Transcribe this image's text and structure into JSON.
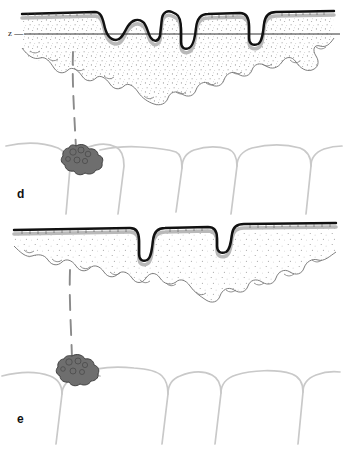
{
  "figure": {
    "background_color": "#ffffff",
    "panels": [
      {
        "id": "d",
        "label": "d",
        "description": "Upper panel: keratinised epithelium with multiple deep invaginations reaching past the reference level z; stippled connective tissue layer; dashed migration path descending to a dark tumour cell cluster positioned between tooth crowns",
        "reference_line": {
          "label": "z",
          "leader_dash": "—",
          "y_position": 34,
          "color": "#1a1a1a"
        },
        "epithelium": {
          "keratin_line_color": "#111111",
          "sub_layer_color": "#b9b9b9",
          "connective_tissue_fill": "#ffffff",
          "stipple_color": "#8e8e8e",
          "invagination_count": 4
        },
        "cell_cluster": {
          "name": "tumour-cell-cluster",
          "fill_color": "#6e6e6e",
          "outline_color": "#3f3f3f",
          "center_x": 75,
          "center_y": 157
        },
        "migration_path": {
          "style": "dashed",
          "color": "#8a8a8a",
          "from_y": 52,
          "to_y": 148
        },
        "teeth": {
          "outline_color": "#c9c9c9",
          "count": 5
        }
      },
      {
        "id": "e",
        "label": "e",
        "description": "Lower panel: flatter keratinised epithelium with one narrow deep invagination and one shallow step; stippled connective tissue; dashed migration path descending to a dark tumour cell cluster between tooth crowns",
        "reference_line": null,
        "epithelium": {
          "keratin_line_color": "#111111",
          "sub_layer_color": "#b9b9b9",
          "connective_tissue_fill": "#ffffff",
          "stipple_color": "#8e8e8e",
          "invagination_count": 2
        },
        "cell_cluster": {
          "name": "tumour-cell-cluster",
          "fill_color": "#6e6e6e",
          "outline_color": "#3f3f3f",
          "center_x": 72,
          "center_y": 368
        },
        "migration_path": {
          "style": "dashed",
          "color": "#8a8a8a",
          "from_y": 272,
          "to_y": 358
        },
        "teeth": {
          "outline_color": "#c9c9c9",
          "count": 5
        }
      }
    ],
    "colors": {
      "ink": "#111111",
      "mid_gray": "#6e6e6e",
      "light_gray": "#c9c9c9",
      "stipple": "#8e8e8e",
      "paper": "#ffffff"
    }
  }
}
